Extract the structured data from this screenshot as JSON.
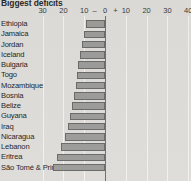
{
  "chart_data": {
    "type": "bar",
    "orientation": "horizontal",
    "title": "Biggest deficits",
    "xlabel": "",
    "ylabel": "",
    "xlim": [
      -35,
      42
    ],
    "grid": true,
    "legend": false,
    "tick_labels": [
      "30",
      "20",
      "10",
      "–",
      "0",
      "+",
      "10",
      "20",
      "30",
      "40"
    ],
    "tick_values": [
      -30,
      -20,
      -10,
      -5,
      0,
      5,
      10,
      20,
      30,
      40
    ],
    "negative_sign_label": "–",
    "positive_sign_label": "+",
    "categories": [
      "Ethiopia",
      "Jamaica",
      "Jordan",
      "Iceland",
      "Bulgaria",
      "Togo",
      "Mozambique",
      "Bosnia",
      "Belize",
      "Guyana",
      "Iraq",
      "Nicaragua",
      "Lebanon",
      "Eritrea",
      "São Tomé & Prin"
    ],
    "values": [
      -9,
      -10,
      -11,
      -12,
      -13,
      -13.5,
      -14,
      -15,
      -16,
      -17,
      -18,
      -19,
      -21,
      -23,
      -25
    ],
    "colors": {
      "background": "#dedcd8",
      "bar_fill": "#9b9b99",
      "bar_border": "#6a6a68",
      "gridline": "#f2f1ee",
      "zero_axis": "#6e6e6e",
      "text": "#1e1e1e"
    }
  }
}
